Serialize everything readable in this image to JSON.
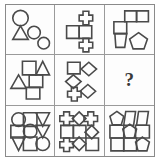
{
  "puzzle": {
    "type": "matrix-reasoning",
    "title": "Visual analogy matrix",
    "rows": 3,
    "columns": 3,
    "missing_cell": "row2-col3",
    "missing_marker": "?",
    "colors": {
      "background": "#ffffff",
      "cell_background": "#fdfdfd",
      "frame_stroke": "#8a8a8a",
      "grid_stroke": "#9a9a9a",
      "shape_stroke": "#4a4a4a",
      "question_color": "#3a3a3a"
    },
    "cells": [
      {
        "id": "row1-col1",
        "row": 1,
        "column": 1,
        "label": "circles and triangle cluster",
        "shape_count": 4,
        "shapes": [
          "circle",
          "triangle",
          "circle",
          "circle"
        ]
      },
      {
        "id": "row1-col2",
        "row": 1,
        "column": 2,
        "label": "squares and crosses column",
        "shape_count": 4,
        "shapes": [
          "cross",
          "square",
          "square",
          "cross"
        ]
      },
      {
        "id": "row1-col3",
        "row": 1,
        "column": 3,
        "label": "squares, quadrilateral and pentagon",
        "shape_count": 5,
        "shapes": [
          "square",
          "square",
          "square",
          "quadrilateral",
          "pentagon"
        ]
      },
      {
        "id": "row2-col1",
        "row": 2,
        "column": 1,
        "label": "squares and triangles stagger",
        "shape_count": 5,
        "shapes": [
          "square",
          "triangle",
          "square",
          "triangle",
          "square"
        ]
      },
      {
        "id": "row2-col2",
        "row": 2,
        "column": 2,
        "label": "square, diamonds and cross stagger",
        "shape_count": 5,
        "shapes": [
          "square",
          "diamond",
          "diamond",
          "cross",
          "diamond"
        ]
      },
      {
        "id": "row2-col3",
        "row": 2,
        "column": 3,
        "label": "missing answer cell",
        "shape_count": 0,
        "shapes": []
      },
      {
        "id": "row3-col1",
        "row": 3,
        "column": 3,
        "label": "three by three circles squares triangles",
        "shape_count": 9,
        "shapes": [
          "circle",
          "square",
          "triangle-down",
          "square",
          "circle",
          "triangle-down",
          "triangle-down",
          "square",
          "circle"
        ]
      },
      {
        "id": "row3-col2",
        "row": 3,
        "column": 2,
        "label": "three by three crosses diamonds squares",
        "shape_count": 9,
        "shapes": [
          "cross",
          "diamond",
          "cross",
          "square",
          "square",
          "diamond",
          "cross",
          "diamond",
          "square"
        ]
      },
      {
        "id": "row3-col3",
        "row": 3,
        "column": 3,
        "label": "three by three pentagons quadrilaterals squares",
        "shape_count": 9,
        "shapes": [
          "pentagon",
          "quadrilateral",
          "quadrilateral",
          "square",
          "pentagon",
          "square",
          "square",
          "square",
          "pentagon"
        ]
      }
    ]
  }
}
